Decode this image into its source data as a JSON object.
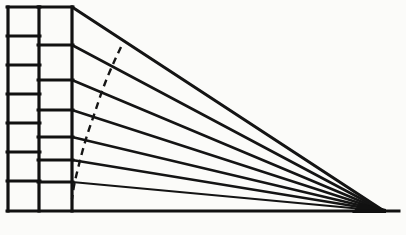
{
  "figure": {
    "type": "line-diagram",
    "background_color": "#fbfbf9",
    "ink_color": "#111111",
    "canvas": {
      "width": 406,
      "height": 235
    }
  },
  "chart_data": {
    "type": "line",
    "xlabel": "",
    "ylabel": "",
    "xlim": [
      0,
      406
    ],
    "ylim": [
      0,
      235
    ],
    "grid": false,
    "legend": null,
    "vanishing_point": {
      "x": 384,
      "y": 211
    },
    "frame": {
      "name": "outer-frame",
      "left": 7,
      "right": 399,
      "top": 7,
      "bottom": 211,
      "note": "left portion closed as grid; right portion converges to apex"
    },
    "columns": [
      {
        "name": "column-one",
        "x_left": 7,
        "x_right": 39,
        "row_boundaries": [
          7,
          36,
          65,
          94,
          123,
          152,
          181,
          211
        ],
        "row_count": 7,
        "description": "equal vertical divisions (true measuring scale)"
      },
      {
        "name": "column-two",
        "x_left": 39,
        "x_right": 72,
        "row_boundaries": [
          7,
          45,
          80,
          110,
          137,
          160,
          182,
          211
        ],
        "row_count": 7,
        "description": "progressively compressed divisions (foreshortened scale)"
      }
    ],
    "rays": {
      "name": "convergence-rays",
      "origin_x": 72,
      "origin_y_values": [
        7,
        45,
        80,
        110,
        137,
        160,
        182,
        211
      ],
      "target": {
        "x": 384,
        "y": 211
      },
      "count": 8,
      "description": "straight lines from the foreshortened scale to the vanishing point"
    },
    "dashed_curve": {
      "name": "measuring-arc",
      "style": "dashed",
      "dash_pattern": "7 5",
      "points": [
        {
          "x": 121,
          "y": 47
        },
        {
          "x": 112,
          "y": 66
        },
        {
          "x": 103,
          "y": 88
        },
        {
          "x": 95,
          "y": 112
        },
        {
          "x": 86,
          "y": 138
        },
        {
          "x": 79,
          "y": 164
        },
        {
          "x": 74,
          "y": 185
        },
        {
          "x": 72,
          "y": 199
        }
      ],
      "description": "curved dashed arc sweeping across the rays down to the base line"
    },
    "series": [
      {
        "name": "ray-1",
        "x": [
          72,
          384
        ],
        "y": [
          7,
          211
        ]
      },
      {
        "name": "ray-2",
        "x": [
          72,
          384
        ],
        "y": [
          45,
          211
        ]
      },
      {
        "name": "ray-3",
        "x": [
          72,
          384
        ],
        "y": [
          80,
          211
        ]
      },
      {
        "name": "ray-4",
        "x": [
          72,
          384
        ],
        "y": [
          110,
          211
        ]
      },
      {
        "name": "ray-5",
        "x": [
          72,
          384
        ],
        "y": [
          137,
          211
        ]
      },
      {
        "name": "ray-6",
        "x": [
          72,
          384
        ],
        "y": [
          160,
          211
        ]
      },
      {
        "name": "ray-7",
        "x": [
          72,
          384
        ],
        "y": [
          182,
          211
        ]
      },
      {
        "name": "ray-8",
        "x": [
          72,
          384
        ],
        "y": [
          211,
          211
        ]
      }
    ]
  }
}
